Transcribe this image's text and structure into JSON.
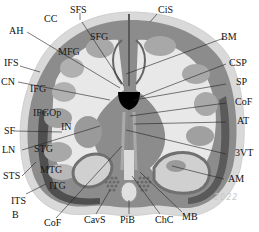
{
  "diagram": {
    "colors": {
      "outer_membrane": "#d4d4d4",
      "gray_matter": "#8a8a8a",
      "dark_sulcus": "#555555",
      "white_matter": "#e6e6e6",
      "ventricle": "#000000",
      "leader_line": "#222222",
      "background": "#ffffff"
    },
    "labels": {
      "CC": "CC",
      "SFS": "SFS",
      "CiS": "CiS",
      "AH": "AH",
      "SFG": "SFG",
      "BM": "BM",
      "MFG": "MFG",
      "IFS": "IFS",
      "CSP": "CSP",
      "CN": "CN",
      "SP": "SP",
      "IFG": "IFG",
      "CoF_right": "CoF",
      "IFGOp": "IFGOp",
      "AT": "AT",
      "SF": "SF",
      "IN": "IN",
      "LN": "LN",
      "STG": "STG",
      "VT3": "3VT",
      "MTG": "MTG",
      "STS": "STS",
      "ITG": "ITG",
      "AM": "AM",
      "ITS": "ITS",
      "B": "B",
      "CoF_bottom": "CoF",
      "CavS": "CavS",
      "PiB": "PiB",
      "ChC": "ChC",
      "MB": "MB"
    },
    "watermark": "2022"
  }
}
